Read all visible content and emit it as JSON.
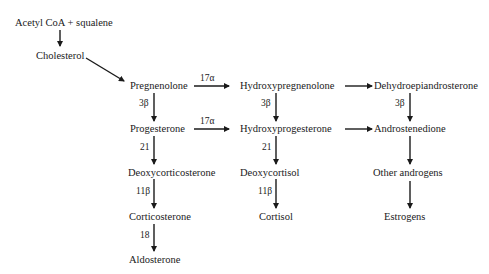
{
  "diagram": {
    "nodes": {
      "acetyl_coa": "Acetyl CoA + squalene",
      "cholesterol": "Cholesterol",
      "pregnenolone": "Pregnenolone",
      "hydroxypregnenolone": "Hydroxypregnenolone",
      "dhea": "Dehydroepiandrosterone",
      "progesterone": "Progesterone",
      "hydroxyprogesterone": "Hydroxyprogesterone",
      "androstenedione": "Androstenedione",
      "deoxycorticosterone": "Deoxycorticosterone",
      "deoxycortisol": "Deoxycortisol",
      "other_androgens": "Other androgens",
      "corticosterone": "Corticosterone",
      "cortisol": "Cortisol",
      "estrogens": "Estrogens",
      "aldosterone": "Aldosterone"
    },
    "edge_labels": {
      "preg_to_hpreg": "17α",
      "prog_to_hprog": "17α",
      "preg_to_prog": "3β",
      "hpreg_to_hprog": "3β",
      "dhea_to_andro": "3β",
      "prog_to_doc": "21",
      "hprog_to_doxcortisol": "21",
      "doc_to_cortico": "11β",
      "doxcortisol_to_cortisol": "11β",
      "cortico_to_aldo": "18"
    },
    "edges": [
      {
        "from": "acetyl_coa",
        "to": "cholesterol"
      },
      {
        "from": "cholesterol",
        "to": "pregnenolone"
      },
      {
        "from": "pregnenolone",
        "to": "hydroxypregnenolone",
        "label": "17α"
      },
      {
        "from": "hydroxypregnenolone",
        "to": "dhea"
      },
      {
        "from": "pregnenolone",
        "to": "progesterone",
        "label": "3β"
      },
      {
        "from": "hydroxypregnenolone",
        "to": "hydroxyprogesterone",
        "label": "3β"
      },
      {
        "from": "dhea",
        "to": "androstenedione",
        "label": "3β"
      },
      {
        "from": "progesterone",
        "to": "hydroxyprogesterone",
        "label": "17α"
      },
      {
        "from": "hydroxyprogesterone",
        "to": "androstenedione"
      },
      {
        "from": "progesterone",
        "to": "deoxycorticosterone",
        "label": "21"
      },
      {
        "from": "hydroxyprogesterone",
        "to": "deoxycortisol",
        "label": "21"
      },
      {
        "from": "androstenedione",
        "to": "other_androgens"
      },
      {
        "from": "deoxycorticosterone",
        "to": "corticosterone",
        "label": "11β"
      },
      {
        "from": "deoxycortisol",
        "to": "cortisol",
        "label": "11β"
      },
      {
        "from": "other_androgens",
        "to": "estrogens"
      },
      {
        "from": "corticosterone",
        "to": "aldosterone",
        "label": "18"
      }
    ]
  }
}
